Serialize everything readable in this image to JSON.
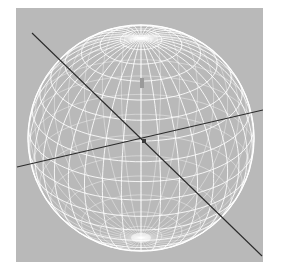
{
  "viewport": {
    "background": "#b9b9b9",
    "wire_color": "#ffffff",
    "axis_color": "#2a2a2a"
  },
  "sphere": {
    "center": [
      125,
      130
    ],
    "radius": 113,
    "latitude_count": 17,
    "longitude_count": 36,
    "tilt_deg": -28
  },
  "axes": [
    {
      "name": "diagonal-axis",
      "from": [
        16,
        25
      ],
      "to": [
        246,
        248
      ]
    },
    {
      "name": "horizontal-axis",
      "from": [
        1,
        159
      ],
      "to": [
        247,
        102
      ]
    }
  ],
  "markers": [
    {
      "name": "axis-origin-marker",
      "at": [
        128,
        133
      ]
    },
    {
      "name": "gizmo-arrow",
      "at": [
        126,
        72
      ]
    }
  ]
}
